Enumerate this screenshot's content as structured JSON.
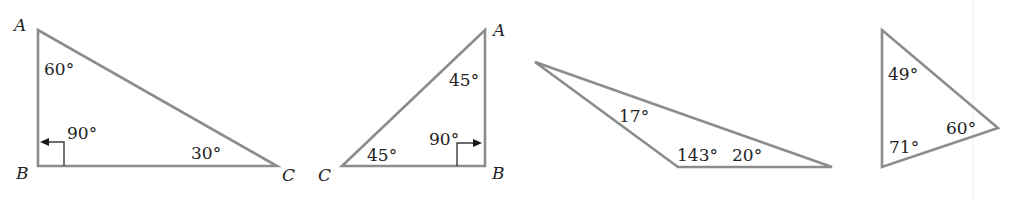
{
  "figure": {
    "colors": {
      "edge": "#8c8c8c",
      "text": "#222222",
      "background": "#ffffff"
    }
  },
  "triangles": [
    {
      "id": "triangle-1",
      "type": "right 30-60-90",
      "vertices": [
        {
          "label": "A",
          "x": 38,
          "y": 30
        },
        {
          "label": "B",
          "x": 38,
          "y": 166
        },
        {
          "label": "C",
          "x": 277,
          "y": 166
        }
      ],
      "angles": [
        {
          "at": "A",
          "value": "60°"
        },
        {
          "at": "B",
          "value": "90°"
        },
        {
          "at": "C",
          "value": "30°"
        }
      ]
    },
    {
      "id": "triangle-2",
      "type": "right isosceles 45-45-90",
      "vertices": [
        {
          "label": "A",
          "x": 485,
          "y": 30
        },
        {
          "label": "B",
          "x": 485,
          "y": 166
        },
        {
          "label": "C",
          "x": 342,
          "y": 166
        }
      ],
      "angles": [
        {
          "at": "A",
          "value": "45°"
        },
        {
          "at": "B",
          "value": "90°"
        },
        {
          "at": "C",
          "value": "45°"
        }
      ]
    },
    {
      "id": "triangle-3",
      "type": "obtuse",
      "vertices": [
        {
          "label": "",
          "x": 535,
          "y": 62
        },
        {
          "label": "",
          "x": 678,
          "y": 167
        },
        {
          "label": "",
          "x": 832,
          "y": 167
        }
      ],
      "angles": [
        {
          "at": "top-left",
          "value": "17°"
        },
        {
          "at": "bottom-left",
          "value": "143°"
        },
        {
          "at": "right",
          "value": "20°"
        }
      ]
    },
    {
      "id": "triangle-4",
      "type": "acute",
      "vertices": [
        {
          "label": "",
          "x": 882,
          "y": 30
        },
        {
          "label": "",
          "x": 882,
          "y": 167
        },
        {
          "label": "",
          "x": 998,
          "y": 128
        }
      ],
      "angles": [
        {
          "at": "top",
          "value": "49°"
        },
        {
          "at": "bottom",
          "value": "71°"
        },
        {
          "at": "right",
          "value": "60°"
        }
      ]
    }
  ]
}
